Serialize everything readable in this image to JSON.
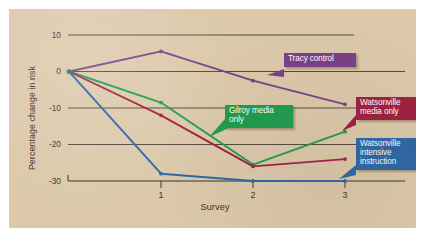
{
  "figure": {
    "plate_color": "#dcc9ab",
    "page_color": "#ffffff"
  },
  "axes": {
    "y_title": "Percentage change in risk",
    "x_title": "Survey",
    "y_ticks": [
      "10",
      "0",
      "-10",
      "-20",
      "-30"
    ],
    "x_ticks": [
      "1",
      "2",
      "3"
    ]
  },
  "callouts": {
    "tracy": "Tracy control",
    "gilroy": "Gilroy media\nonly",
    "watsonville_media": "Watsonville\nmedia only",
    "watsonville_intensive": "Watsonville\nintensive\ninstruction"
  },
  "chart_data": {
    "type": "line",
    "title": "",
    "xlabel": "Survey",
    "ylabel": "Percentage change in risk",
    "x": [
      0,
      1,
      2,
      3
    ],
    "x_tick_labels": [
      "",
      "1",
      "2",
      "3"
    ],
    "xlim": [
      0,
      3.2
    ],
    "ylim": [
      -32,
      12
    ],
    "y_ticks": [
      10,
      0,
      -10,
      -20,
      -30
    ],
    "grid": "horizontal",
    "legend": "callout-labels",
    "series": [
      {
        "name": "Tracy control",
        "color": "#7b3f86",
        "values": [
          0,
          5.5,
          -2.5,
          -9.0
        ]
      },
      {
        "name": "Gilroy media only",
        "color": "#1c9c4e",
        "values": [
          0,
          -8.5,
          -25.5,
          -16.5
        ]
      },
      {
        "name": "Watsonville media only",
        "color": "#9e1f42",
        "values": [
          0,
          -12.0,
          -26.0,
          -24.0
        ]
      },
      {
        "name": "Watsonville intensive instruction",
        "color": "#2a66a8",
        "values": [
          0,
          -28.0,
          -30.0,
          -30.0
        ]
      }
    ]
  }
}
